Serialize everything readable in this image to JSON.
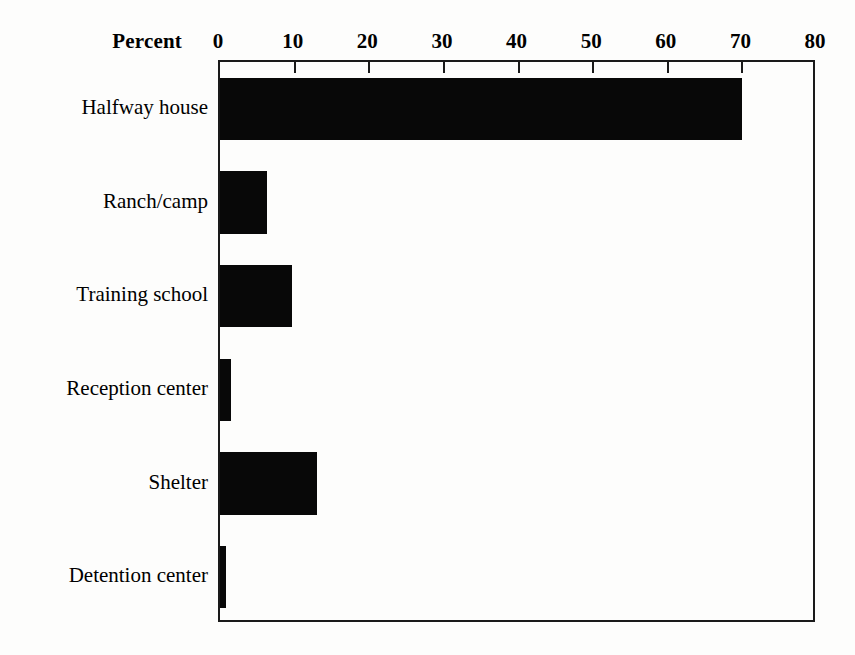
{
  "chart_data": {
    "type": "bar",
    "orientation": "horizontal",
    "title": "",
    "xlabel": "Percent",
    "ylabel": "",
    "xlim": [
      0,
      80
    ],
    "xticks": [
      0,
      10,
      20,
      30,
      40,
      50,
      60,
      70,
      80
    ],
    "xtick_labels": [
      "0",
      "10",
      "20",
      "30",
      "40",
      "50",
      "60",
      "70",
      "80"
    ],
    "grid": false,
    "legend": false,
    "bar_color": "#080808",
    "frame_color": "#1a1a1a",
    "background_color": "#fdfdfc",
    "categories": [
      "Halfway house",
      "Ranch/camp",
      "Training school",
      "Reception center",
      "Shelter",
      "Detention center"
    ],
    "values": [
      70,
      6.3,
      9.6,
      1.5,
      13,
      0.8
    ],
    "series": [
      {
        "name": "Percent",
        "values": [
          70,
          6.3,
          9.6,
          1.5,
          13,
          0.8
        ]
      }
    ]
  }
}
